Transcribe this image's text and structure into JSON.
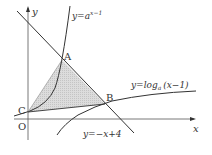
{
  "diagram": {
    "axes": {
      "x_label": "x",
      "y_label": "y",
      "origin_label": "O"
    },
    "curves": [
      {
        "id": "exp",
        "label_prefix": "y=a",
        "label_sup": "x−1"
      },
      {
        "id": "log",
        "label_prefix": "y=log",
        "label_sub": "a",
        "label_suffix": "(x−1)"
      },
      {
        "id": "line",
        "label": "y=−x+4"
      }
    ],
    "points": [
      {
        "name": "A"
      },
      {
        "name": "B"
      },
      {
        "name": "C"
      }
    ],
    "colors": {
      "stroke": "#333333",
      "shade": "#d4d4d4"
    }
  }
}
